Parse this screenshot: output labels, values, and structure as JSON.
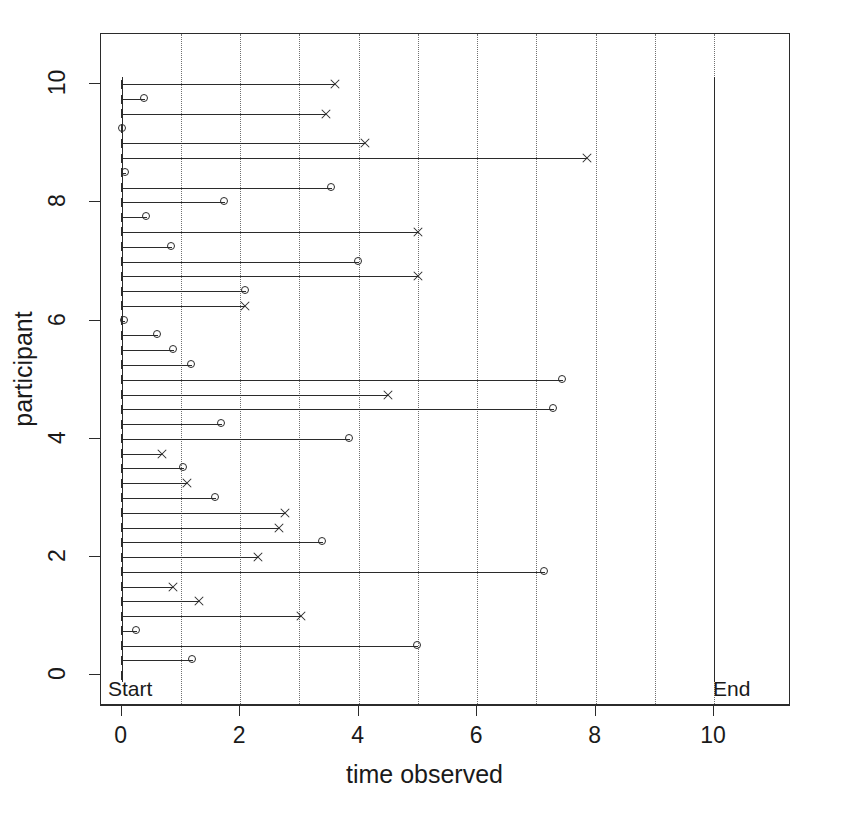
{
  "chart_data": {
    "type": "scatter",
    "title": "",
    "xlabel": "time observed",
    "ylabel": "participant",
    "xlim": [
      -0.35,
      11.3
    ],
    "ylim": [
      -0.52,
      10.85
    ],
    "grid": "vertical dotted gridlines at every integer time from 1 to 10",
    "legend": "none",
    "xticks": [
      0,
      2,
      4,
      6,
      8,
      10
    ],
    "xticklabels": [
      "0",
      "2",
      "4",
      "6",
      "8",
      "10"
    ],
    "yticks": [
      0,
      2,
      4,
      6,
      8,
      10
    ],
    "yticklabels": [
      "0",
      "2",
      "4",
      "6",
      "8",
      "10"
    ],
    "annotations": [
      {
        "text": "Start",
        "x": 0,
        "y": 0,
        "note": "label at left bottom inside plot, vertical rule at time 0"
      },
      {
        "text": "End",
        "x": 10,
        "y": 0,
        "note": "label at right bottom inside plot, vertical rule at time 10"
      }
    ],
    "marker_semantics": {
      "o": "censored / still in study (open circle)",
      "x": "event observed (cross)"
    },
    "series": [
      {
        "name": "follow-up segments",
        "note": "each horizontal segment runs from time 0 to the observed time; y is the participant row",
        "points": [
          {
            "y": 10.0,
            "time": 3.6,
            "marker": "x"
          },
          {
            "y": 9.75,
            "time": 0.4,
            "marker": "o"
          },
          {
            "y": 9.5,
            "time": 3.45,
            "marker": "x"
          },
          {
            "y": 9.25,
            "time": 0.02,
            "marker": "o"
          },
          {
            "y": 9.0,
            "time": 4.1,
            "marker": "x"
          },
          {
            "y": 8.75,
            "time": 7.85,
            "marker": "x"
          },
          {
            "y": 8.5,
            "time": 0.07,
            "marker": "o"
          },
          {
            "y": 8.25,
            "time": 3.55,
            "marker": "o"
          },
          {
            "y": 8.0,
            "time": 1.75,
            "marker": "o"
          },
          {
            "y": 7.75,
            "time": 0.43,
            "marker": "o"
          },
          {
            "y": 7.5,
            "time": 5.0,
            "marker": "x"
          },
          {
            "y": 7.25,
            "time": 0.85,
            "marker": "o"
          },
          {
            "y": 7.0,
            "time": 4.0,
            "marker": "o"
          },
          {
            "y": 6.75,
            "time": 5.0,
            "marker": "x"
          },
          {
            "y": 6.5,
            "time": 2.1,
            "marker": "o"
          },
          {
            "y": 6.25,
            "time": 2.08,
            "marker": "x"
          },
          {
            "y": 6.0,
            "time": 0.06,
            "marker": "o"
          },
          {
            "y": 5.75,
            "time": 0.62,
            "marker": "o"
          },
          {
            "y": 5.5,
            "time": 0.88,
            "marker": "o"
          },
          {
            "y": 5.25,
            "time": 1.18,
            "marker": "o"
          },
          {
            "y": 5.0,
            "time": 7.45,
            "marker": "o"
          },
          {
            "y": 4.75,
            "time": 4.5,
            "marker": "x"
          },
          {
            "y": 4.5,
            "time": 7.3,
            "marker": "o"
          },
          {
            "y": 4.25,
            "time": 1.7,
            "marker": "o"
          },
          {
            "y": 4.0,
            "time": 3.85,
            "marker": "o"
          },
          {
            "y": 3.75,
            "time": 0.68,
            "marker": "x"
          },
          {
            "y": 3.5,
            "time": 1.05,
            "marker": "o"
          },
          {
            "y": 3.25,
            "time": 1.1,
            "marker": "x"
          },
          {
            "y": 3.0,
            "time": 1.6,
            "marker": "o"
          },
          {
            "y": 2.75,
            "time": 2.75,
            "marker": "x"
          },
          {
            "y": 2.5,
            "time": 2.65,
            "marker": "x"
          },
          {
            "y": 2.25,
            "time": 3.4,
            "marker": "o"
          },
          {
            "y": 2.0,
            "time": 2.3,
            "marker": "x"
          },
          {
            "y": 1.75,
            "time": 7.15,
            "marker": "o"
          },
          {
            "y": 1.5,
            "time": 0.87,
            "marker": "x"
          },
          {
            "y": 1.25,
            "time": 1.3,
            "marker": "x"
          },
          {
            "y": 1.0,
            "time": 3.02,
            "marker": "x"
          },
          {
            "y": 0.75,
            "time": 0.25,
            "marker": "o"
          },
          {
            "y": 0.5,
            "time": 5.0,
            "marker": "o"
          },
          {
            "y": 0.25,
            "time": 1.2,
            "marker": "o"
          },
          {
            "y": 0.0,
            "time": 0.0,
            "marker": "none"
          }
        ]
      }
    ]
  },
  "axes": {
    "x_label": "time observed",
    "y_label": "participant",
    "x_tick_labels": [
      "0",
      "2",
      "4",
      "6",
      "8",
      "10"
    ],
    "y_tick_labels": [
      "0",
      "2",
      "4",
      "6",
      "8",
      "10"
    ]
  },
  "labels": {
    "start": "Start",
    "end": "End"
  },
  "colors": {
    "foreground": "#2b2b2b",
    "grid": "#707070",
    "background": "#ffffff"
  }
}
